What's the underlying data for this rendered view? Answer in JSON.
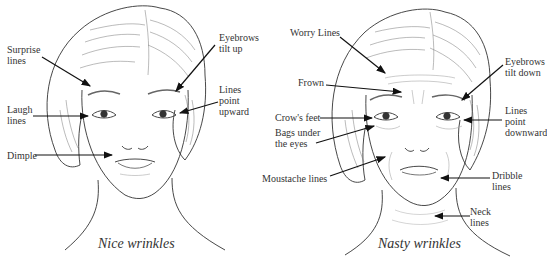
{
  "panels": [
    {
      "caption": "Nice wrinkles",
      "labels": {
        "surprise": "Surprise\nlines",
        "laugh": "Laugh\nlines",
        "dimple": "Dimple",
        "eyebrows": "Eyebrows\ntilt up",
        "lines_point": "Lines\npoint\nupward"
      }
    },
    {
      "caption": "Nasty wrinkles",
      "labels": {
        "worry": "Worry Lines",
        "frown": "Frown",
        "crows": "Crow's feet",
        "bags": "Bags under\nthe eyes",
        "moustache": "Moustache lines",
        "eyebrows": "Eyebrows\ntilt down",
        "lines_point": "Lines\npoint\ndownward",
        "dribble": "Dribble\nlines",
        "neck": "Neck\nlines"
      }
    }
  ],
  "colors": {
    "ink": "#222222",
    "hair": "#555555",
    "background": "#ffffff"
  }
}
